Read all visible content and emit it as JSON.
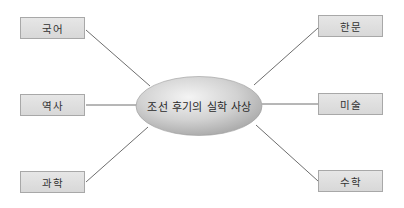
{
  "diagram": {
    "type": "mind-map",
    "center": {
      "label": "조선 후기의 실학 사상",
      "shape": "ellipse",
      "fill_light": "#f2f2f2",
      "fill_dark": "#a9a9a9"
    },
    "branches": {
      "left": [
        {
          "label": "국어"
        },
        {
          "label": "역사"
        },
        {
          "label": "과학"
        }
      ],
      "right": [
        {
          "label": "한문"
        },
        {
          "label": "미술"
        },
        {
          "label": "수학"
        }
      ]
    },
    "colors": {
      "box_fill": "#dedede",
      "box_border": "#a8a8a8",
      "line": "#6e6e6e",
      "text": "#333333"
    }
  }
}
